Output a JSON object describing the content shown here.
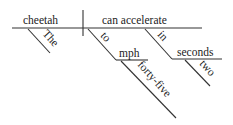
{
  "diagram": {
    "type": "sentence-diagram",
    "subject": "cheetah",
    "predicate": "can accelerate",
    "modifiers": {
      "subject_article": "The",
      "prep1": "to",
      "prep1_object": "mph",
      "prep1_object_modifier": "forty-five",
      "prep2": "in",
      "prep2_object": "seconds",
      "prep2_object_modifier": "two"
    }
  },
  "colors": {
    "line": "#333333",
    "text": "#222222",
    "background": "#ffffff"
  }
}
